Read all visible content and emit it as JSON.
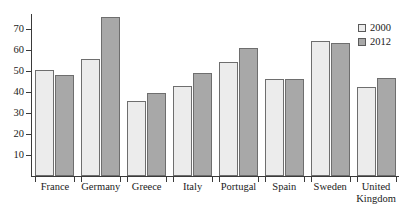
{
  "chart_data": {
    "type": "bar",
    "title": "",
    "xlabel": "",
    "ylabel": "",
    "ylim": [
      0,
      78
    ],
    "yticks": [
      10,
      20,
      30,
      40,
      50,
      60,
      70
    ],
    "grid": false,
    "legend_position": "top-right",
    "categories": [
      "France",
      "Germany",
      "Greece",
      "Italy",
      "Portugal",
      "Spain",
      "Sweden",
      "United Kingdom"
    ],
    "series": [
      {
        "name": "2000",
        "color": "#ececec",
        "values": [
          50.5,
          55.5,
          35.7,
          43.0,
          54.3,
          46.2,
          64.3,
          42.4
        ]
      },
      {
        "name": "2012",
        "color": "#a8a8a8",
        "values": [
          48.0,
          75.5,
          39.5,
          49.0,
          61.0,
          46.2,
          63.3,
          46.7
        ]
      }
    ]
  },
  "axis": {
    "y_tick_labels": [
      "70",
      "60",
      "50",
      "40",
      "30",
      "20",
      "10"
    ]
  },
  "legend": {
    "items": [
      {
        "label": "2000",
        "swatch": "legend-swatch-2000"
      },
      {
        "label": "2012",
        "swatch": "legend-swatch-2012"
      }
    ]
  },
  "title_remnant": "",
  "colors": {
    "series_2000": "#ececec",
    "series_2012": "#a8a8a8",
    "bar_outline": "#6e6e6e",
    "axis": "#3a3a3a",
    "text": "#1a1a1a"
  }
}
